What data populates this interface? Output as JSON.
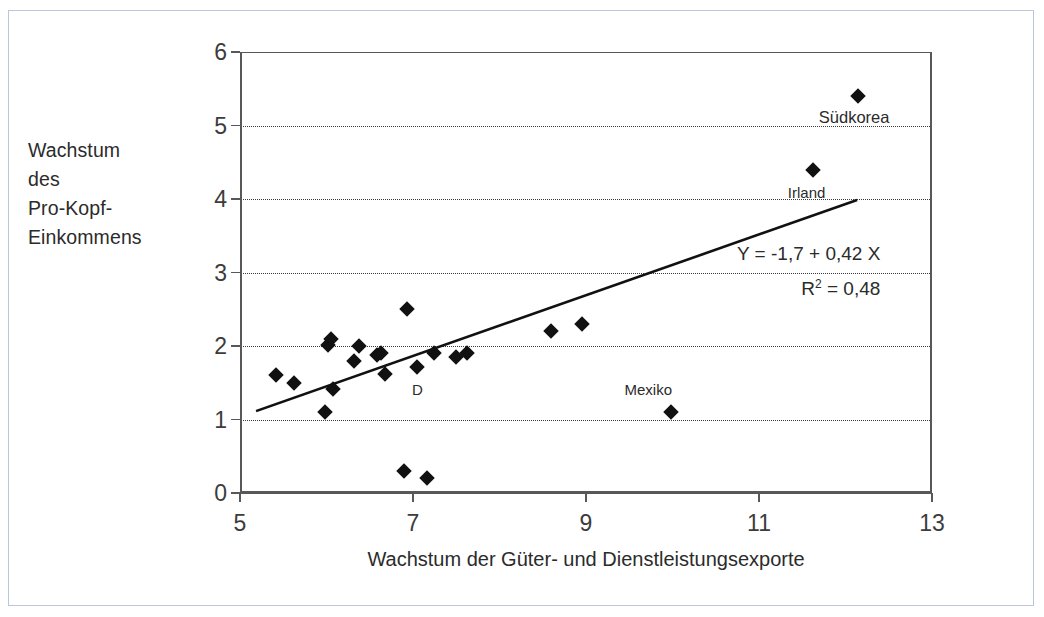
{
  "figure": {
    "border_color": "#b9c6dd",
    "background": "#ffffff",
    "marker_color": "#111111",
    "axis_color": "#58585a"
  },
  "axes": {
    "ylabel_lines": [
      "Wachstum",
      "des",
      "Pro-Kopf-",
      "Einkommens"
    ],
    "xlabel": "Wachstum der Güter- und Dienstleistungsexporte",
    "ytick_labels": [
      "0",
      "1",
      "2",
      "3",
      "4",
      "5",
      "6"
    ],
    "xtick_labels": [
      "5",
      "7",
      "9",
      "11",
      "13"
    ]
  },
  "annotations": {
    "equation": "Y = -1,7 + 0,42 X",
    "r2_prefix": "R",
    "r2_exponent": "2",
    "r2_value": "= 0,48",
    "labels": [
      {
        "text": "Südkorea",
        "x": 12.1,
        "y": 5.12
      },
      {
        "text": "Irland",
        "x": 11.55,
        "y": 4.1
      },
      {
        "text": "Mexiko",
        "x": 9.72,
        "y": 1.42
      },
      {
        "text": "D",
        "x": 7.05,
        "y": 1.42
      }
    ]
  },
  "chart_data": {
    "type": "scatter",
    "title": "",
    "xlabel": "Wachstum der Güter- und Dienstleistungsexporte",
    "ylabel": "Wachstum des Pro-Kopf-Einkommens",
    "xlim": [
      5,
      13
    ],
    "ylim": [
      0,
      6
    ],
    "xticks": [
      5,
      7,
      9,
      11,
      13
    ],
    "yticks": [
      0,
      1,
      2,
      3,
      4,
      5,
      6
    ],
    "grid": "horizontal-dotted",
    "legend": "none",
    "points": [
      {
        "x": 5.42,
        "y": 1.6
      },
      {
        "x": 5.62,
        "y": 1.49
      },
      {
        "x": 5.98,
        "y": 1.1
      },
      {
        "x": 6.02,
        "y": 2.02
      },
      {
        "x": 6.05,
        "y": 2.1
      },
      {
        "x": 6.08,
        "y": 1.41
      },
      {
        "x": 6.32,
        "y": 1.8
      },
      {
        "x": 6.38,
        "y": 2.0
      },
      {
        "x": 6.58,
        "y": 1.88
      },
      {
        "x": 6.63,
        "y": 1.9
      },
      {
        "x": 6.68,
        "y": 1.62
      },
      {
        "x": 6.9,
        "y": 0.3
      },
      {
        "x": 6.93,
        "y": 2.5
      },
      {
        "x": 7.05,
        "y": 1.71
      },
      {
        "x": 7.16,
        "y": 0.2
      },
      {
        "x": 7.24,
        "y": 1.9
      },
      {
        "x": 7.5,
        "y": 1.85
      },
      {
        "x": 7.63,
        "y": 1.9
      },
      {
        "x": 8.6,
        "y": 2.2
      },
      {
        "x": 8.95,
        "y": 2.3
      },
      {
        "x": 9.98,
        "y": 1.1
      },
      {
        "x": 11.62,
        "y": 4.4
      },
      {
        "x": 12.15,
        "y": 5.4
      }
    ],
    "fit_line": {
      "equation": "Y = -1,7 + 0,42 X",
      "intercept": -1.7,
      "slope": 0.42,
      "r_squared": 0.48,
      "x_start": 5.2,
      "y_start": 1.12,
      "x_end": 12.12,
      "y_end": 3.98
    }
  }
}
